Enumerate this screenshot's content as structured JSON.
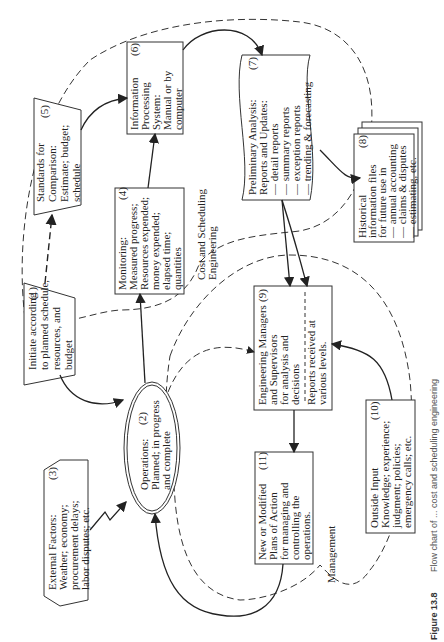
{
  "diagram": {
    "orientation": "rotated-90-ccw",
    "nodes": [
      {
        "id": 1,
        "num": "(1)",
        "shape": "trapezoid",
        "lines": [
          "Initiate according",
          "to planned schedule,",
          "resources, and",
          "budget"
        ]
      },
      {
        "id": 2,
        "num": "(2)",
        "shape": "double-ellipse",
        "lines": [
          "Operations:",
          "Planned; in progress",
          "and complete"
        ]
      },
      {
        "id": 3,
        "num": "(3)",
        "shape": "hexagon",
        "lines": [
          "External Factors:",
          "Weather; economy;",
          "procurement delays;",
          "labor disputes; etc."
        ]
      },
      {
        "id": 4,
        "num": "(4)",
        "shape": "rectangle",
        "lines": [
          "Monitoring:",
          "Measured progress;",
          "Resources expended;",
          "money expended;",
          "elapsed time;",
          "quantities"
        ]
      },
      {
        "id": 5,
        "num": "(5)",
        "shape": "trapezoid",
        "lines": [
          "Standards for",
          "Comparison:",
          "Estimate; budget;",
          "schedule"
        ]
      },
      {
        "id": 6,
        "num": "(6)",
        "shape": "rectangle",
        "lines": [
          "Information",
          "Processing",
          "System:",
          "Manual or by",
          "computer"
        ]
      },
      {
        "id": 7,
        "num": "(7)",
        "shape": "document",
        "lines": [
          "Preliminary Analysis:",
          "Reports and Updates:",
          "— detail reports",
          "— summary reports",
          "— exception reports",
          "— trending & forecasting"
        ]
      },
      {
        "id": 8,
        "num": "(8)",
        "shape": "stacked-documents",
        "lines": [
          "Historical",
          "information files",
          "for future use in",
          "— annual accounting",
          "— claims & disputes",
          "— estimating, etc."
        ]
      },
      {
        "id": 9,
        "num": "(9)",
        "shape": "rectangle-divided",
        "lines": [
          "Engineering Managers",
          "and Supervisors",
          "for analysis and",
          "decisions"
        ],
        "lower_lines": [
          "Reports received at",
          "various levels."
        ]
      },
      {
        "id": 10,
        "num": "(10)",
        "shape": "rectangle",
        "lines": [
          "Outside Input",
          "Knowledge; experience;",
          "judgment; policies;",
          "emergency calls; etc."
        ]
      },
      {
        "id": 11,
        "num": "(11)",
        "shape": "rectangle",
        "lines": [
          "New or Modified",
          "Plans of Action",
          "for managing and",
          "controlling the",
          "operations."
        ]
      }
    ],
    "regions": [
      {
        "label": "Cost and Scheduling Engineering",
        "lines": [
          "Cost and Scheduling",
          "Engineering"
        ]
      },
      {
        "label": "Management",
        "lines": [
          "Management"
        ]
      }
    ],
    "edges": [
      {
        "from": 1,
        "to": 5,
        "style": "dashed"
      },
      {
        "from": 1,
        "to": 2,
        "style": "solid"
      },
      {
        "from": 2,
        "to": 4,
        "style": "solid"
      },
      {
        "from": 2,
        "to": 9,
        "style": "dashed"
      },
      {
        "from": 3,
        "to": 2,
        "style": "zigzag"
      },
      {
        "from": 4,
        "to": 6,
        "style": "solid"
      },
      {
        "from": 5,
        "to": 6,
        "style": "solid"
      },
      {
        "from": 6,
        "to": 7,
        "style": "solid"
      },
      {
        "from": 7,
        "to": 8,
        "style": "solid"
      },
      {
        "from": 7,
        "to": 9,
        "style": "solid"
      },
      {
        "from": 10,
        "to": 9,
        "style": "solid"
      },
      {
        "from": 9,
        "to": 11,
        "style": "solid"
      },
      {
        "from": 11,
        "to": 2,
        "style": "solid"
      }
    ],
    "caption": {
      "prefix": "Figure 13.8",
      "text": "Flow chart of ... cost and scheduling engineering"
    }
  }
}
